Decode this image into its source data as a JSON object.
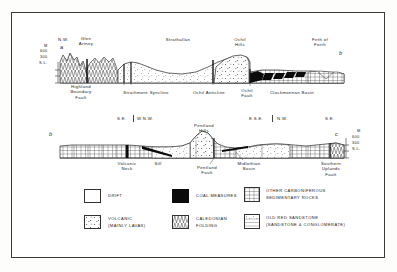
{
  "figure": {
    "border_color": "#3a3a3a",
    "background": "#ffffff"
  },
  "sections": [
    {
      "id": "section-a-b",
      "start_label": "a",
      "end_label": "b",
      "scale": {
        "unit": "M",
        "ticks": [
          "600",
          "300",
          "S.L."
        ]
      },
      "direction_labels": [
        {
          "text": "N.W.",
          "x": 63,
          "y": 41
        }
      ],
      "place_labels": [
        {
          "text": "Glen\nArtney",
          "x": 85,
          "y": 40
        },
        {
          "text": "Strathallan",
          "x": 177,
          "y": 39
        },
        {
          "text": "Ochil\nHills",
          "x": 239,
          "y": 39
        },
        {
          "text": "Firth of\nForth",
          "x": 320,
          "y": 40
        }
      ],
      "structure_labels": [
        {
          "text": "Highland\nBoundary\nFault",
          "x": 81,
          "y": 83
        },
        {
          "text": "Strathmore Syncline",
          "x": 143,
          "y": 88
        },
        {
          "text": "Ochil Anticline",
          "x": 208,
          "y": 88
        },
        {
          "text": "Ochil\nFault",
          "x": 245,
          "y": 86
        },
        {
          "text": "Clackmannan Basin",
          "x": 290,
          "y": 88
        }
      ]
    },
    {
      "id": "section-b-c",
      "start_label": "b",
      "end_label": "c",
      "scale": {
        "unit": "M",
        "ticks": [
          "600",
          "300",
          "S.L."
        ]
      },
      "direction_labels": [
        {
          "text": "S.E.",
          "x": 120,
          "y": 118
        },
        {
          "text": "W.N.W.",
          "x": 140,
          "y": 118
        },
        {
          "text": "E.S.E.",
          "x": 253,
          "y": 118
        },
        {
          "text": "N.W.",
          "x": 283,
          "y": 118
        },
        {
          "text": "S.E.",
          "x": 330,
          "y": 118
        }
      ],
      "place_labels": [
        {
          "text": "Pentland\nHills",
          "x": 203,
          "y": 124
        }
      ],
      "structure_labels": [
        {
          "text": "Volcanic\nNeck",
          "x": 126,
          "y": 163
        },
        {
          "text": "Sill",
          "x": 157,
          "y": 163
        },
        {
          "text": "Pentland\nFault",
          "x": 209,
          "y": 166
        },
        {
          "text": "Midlothian\nBasin",
          "x": 247,
          "y": 163
        },
        {
          "text": "Southern\nUplands\nFault",
          "x": 330,
          "y": 163
        }
      ]
    }
  ],
  "legend": {
    "items": [
      {
        "id": "drift",
        "pattern": "blank",
        "label": "DRIFT",
        "label2": ""
      },
      {
        "id": "coal-measures",
        "pattern": "solid-black",
        "label": "COAL MEASURES",
        "label2": ""
      },
      {
        "id": "other-carboniferous",
        "pattern": "grid",
        "label": "OTHER CARBONIFEROUS",
        "label2": "SEDIMENTARY ROCKS"
      },
      {
        "id": "volcanic",
        "pattern": "dots-dashes",
        "label": "VOLCANIC",
        "label2": "(MAINLY LAVAS)"
      },
      {
        "id": "caledonian-folding",
        "pattern": "zigzag",
        "label": "CALEDONIAN",
        "label2": "FOLDING"
      },
      {
        "id": "old-red-sandstone",
        "pattern": "dotted-lines",
        "label": "OLD RED SANDSTONE",
        "label2": "(SANDSTONE & CONGLOMERATE)"
      }
    ]
  }
}
